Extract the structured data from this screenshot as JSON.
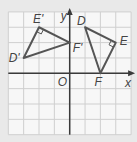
{
  "diagram": {
    "type": "coordinate-plane-rotation",
    "grid": {
      "xmin": -4,
      "xmax": 4,
      "ymin": -4,
      "ymax": 4,
      "origin_px": [
        69.7,
        73.3
      ],
      "cell_px": 15.35
    },
    "axes": {
      "x_label": "x",
      "y_label": "y",
      "origin_label": "O"
    },
    "triangles": [
      {
        "name": "DEF",
        "vertices": [
          {
            "label": "D",
            "x": 1,
            "y": 3
          },
          {
            "label": "E",
            "x": 3,
            "y": 2
          },
          {
            "label": "F",
            "x": 2,
            "y": 0
          }
        ],
        "right_angle_at": "E"
      },
      {
        "name": "D'E'F'",
        "vertices": [
          {
            "label": "D'",
            "x": -3,
            "y": 1
          },
          {
            "label": "E'",
            "x": -2,
            "y": 3
          },
          {
            "label": "F'",
            "x": 0,
            "y": 2
          }
        ],
        "right_angle_at": "E'"
      }
    ],
    "colors": {
      "background": "#e9e9e9",
      "grid_bg": "#f7f7f7",
      "grid_line": "#cfcfcf",
      "axis": "#3a3a3a",
      "triangle": "#555555",
      "label": "#444444"
    }
  }
}
